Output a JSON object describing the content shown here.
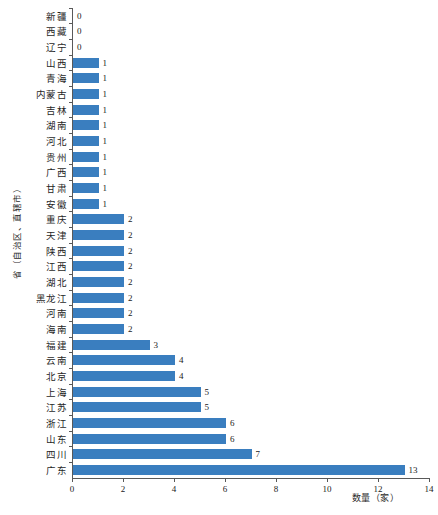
{
  "chart_data": {
    "type": "bar",
    "orientation": "horizontal",
    "title": "",
    "xlabel": "数量（家）",
    "ylabel": "省（自治区、直辖市）",
    "xlim": [
      0,
      14
    ],
    "xticks": [
      0,
      2,
      4,
      6,
      8,
      10,
      12,
      14
    ],
    "xtick_labels": [
      "0",
      "2",
      "4",
      "6",
      "8",
      "10",
      "12",
      "14"
    ],
    "grid": false,
    "legend": null,
    "bar_color": "#3a7ebf",
    "axis_color": "#595959",
    "categories": [
      "新疆",
      "西藏",
      "辽宁",
      "山西",
      "青海",
      "内蒙古",
      "吉林",
      "湖南",
      "河北",
      "贵州",
      "广西",
      "甘肃",
      "安徽",
      "重庆",
      "天津",
      "陕西",
      "江西",
      "湖北",
      "黑龙江",
      "河南",
      "海南",
      "福建",
      "云南",
      "北京",
      "上海",
      "江苏",
      "浙江",
      "山东",
      "四川",
      "广东"
    ],
    "values": [
      0,
      0,
      0,
      1,
      1,
      1,
      1,
      1,
      1,
      1,
      1,
      1,
      1,
      2,
      2,
      2,
      2,
      2,
      2,
      2,
      2,
      3,
      4,
      4,
      5,
      5,
      6,
      6,
      7,
      13
    ],
    "value_labels": [
      "0",
      "0",
      "0",
      "1",
      "1",
      "1",
      "1",
      "1",
      "1",
      "1",
      "1",
      "1",
      "1",
      "2",
      "2",
      "2",
      "2",
      "2",
      "2",
      "2",
      "2",
      "3",
      "4",
      "4",
      "5",
      "5",
      "6",
      "6",
      "7",
      "13"
    ]
  }
}
